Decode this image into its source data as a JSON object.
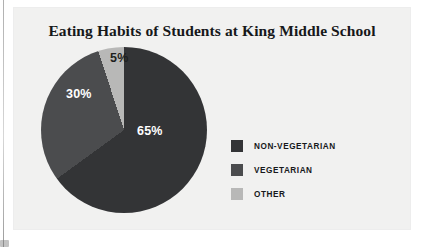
{
  "chart_data": {
    "type": "pie",
    "title": "Eating Habits of Students at King Middle School",
    "xlabel": "",
    "ylabel": "",
    "legend_position": "right",
    "grid": false,
    "start_angle_deg": 0,
    "direction": "clockwise",
    "categories": [
      "NON-VEGETARIAN",
      "VEGETARIAN",
      "OTHER"
    ],
    "values": [
      65,
      30,
      5
    ],
    "value_labels": [
      "65%",
      "30%",
      "5%"
    ],
    "colors": [
      "#333436",
      "#4b4c4e",
      "#b8b8b7"
    ],
    "slices": [
      {
        "label": "NON-VEGETARIAN",
        "value": 65,
        "value_label": "65%",
        "color": "#333436",
        "label_text_color": "#ffffff"
      },
      {
        "label": "VEGETARIAN",
        "value": 30,
        "value_label": "30%",
        "color": "#4b4c4e",
        "label_text_color": "#ffffff"
      },
      {
        "label": "OTHER",
        "value": 5,
        "value_label": "5%",
        "color": "#b8b8b7",
        "label_text_color": "#1d1f20"
      }
    ]
  },
  "panel": {
    "background_color": "#f1f1f0"
  },
  "title": {
    "text": "Eating Habits of Students at King Middle School"
  },
  "legend": {
    "items": [
      {
        "label": "NON-VEGETARIAN",
        "color": "#333436"
      },
      {
        "label": "VEGETARIAN",
        "color": "#4b4c4e"
      },
      {
        "label": "OTHER",
        "color": "#b8b8b7"
      }
    ]
  }
}
